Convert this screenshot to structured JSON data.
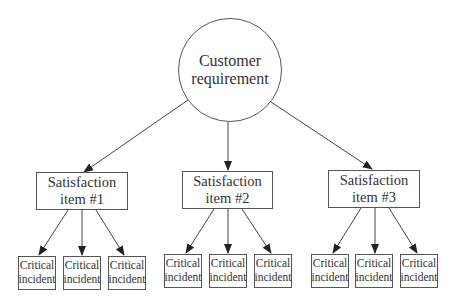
{
  "root": {
    "line1": "Customer",
    "line2": "requirement"
  },
  "items": [
    {
      "line1": "Satisfaction",
      "line2": "item #1",
      "incidents": [
        {
          "line1": "Critical",
          "line2": "incident"
        },
        {
          "line1": "Critical",
          "line2": "incident"
        },
        {
          "line1": "Critical",
          "line2": "incident"
        }
      ]
    },
    {
      "line1": "Satisfaction",
      "line2": "item #2",
      "incidents": [
        {
          "line1": "Critical",
          "line2": "incident"
        },
        {
          "line1": "Critical",
          "line2": "incident"
        },
        {
          "line1": "Critical",
          "line2": "incident"
        }
      ]
    },
    {
      "line1": "Satisfaction",
      "line2": "item #3",
      "incidents": [
        {
          "line1": "Critical",
          "line2": "incident"
        },
        {
          "line1": "Critical",
          "line2": "incident"
        },
        {
          "line1": "Critical",
          "line2": "incident"
        }
      ]
    }
  ]
}
